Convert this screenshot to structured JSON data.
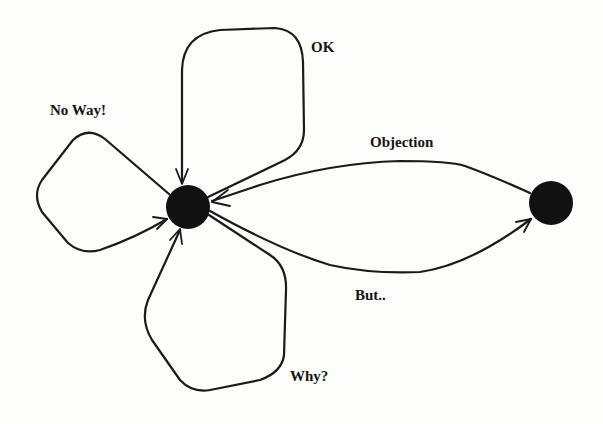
{
  "diagram": {
    "type": "state-transition",
    "nodes": [
      {
        "id": "center",
        "cx": 188,
        "cy": 207,
        "r": 22,
        "color": "#111111"
      },
      {
        "id": "right",
        "cx": 551,
        "cy": 203,
        "r": 22,
        "color": "#111111"
      }
    ],
    "edges": [
      {
        "id": "ok",
        "from": "center",
        "to": "center",
        "label": "OK"
      },
      {
        "id": "no-way",
        "from": "center",
        "to": "center",
        "label": "No Way!"
      },
      {
        "id": "why",
        "from": "center",
        "to": "center",
        "label": "Why?"
      },
      {
        "id": "objection",
        "from": "right",
        "to": "center",
        "label": "Objection"
      },
      {
        "id": "but",
        "from": "center",
        "to": "right",
        "label": "But.."
      }
    ]
  },
  "labels": {
    "ok": "OK",
    "no_way": "No Way!",
    "objection": "Objection",
    "but": "But..",
    "why": "Why?"
  }
}
